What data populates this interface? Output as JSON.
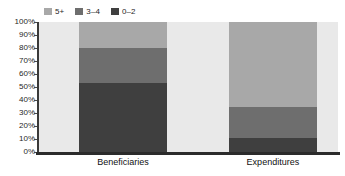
{
  "chart_data": {
    "type": "bar",
    "subtype": "stacked-percent-column",
    "title": "",
    "subtitle": "",
    "xlabel": "",
    "ylabel": "",
    "categories": [
      "Beneficiaries",
      "Expenditures"
    ],
    "series": [
      {
        "name": "0–2",
        "values": [
          53,
          11
        ],
        "color": "#3f3f3f"
      },
      {
        "name": "3–4",
        "values": [
          27,
          24
        ],
        "color": "#6e6e6e"
      },
      {
        "name": "5+",
        "values": [
          20,
          65
        ],
        "color": "#a8a8a8"
      }
    ],
    "stack_order_bottom_to_top": [
      "0–2",
      "3–4",
      "5+"
    ],
    "ylim": [
      0,
      100
    ],
    "ytick_values": [
      0,
      10,
      20,
      30,
      40,
      50,
      60,
      70,
      80,
      90,
      100
    ],
    "ytick_labels": [
      "0%",
      "10%",
      "20%",
      "30%",
      "40%",
      "50%",
      "60%",
      "70%",
      "80%",
      "90%",
      "100%"
    ],
    "grid": false,
    "legend_position": "top-left",
    "legend_order": [
      "5+",
      "3–4",
      "0–2"
    ],
    "plot_background": "#e9e9e9",
    "axis_color": "#2b2b2b"
  },
  "legend": {
    "items": [
      {
        "label": "5+",
        "color": "#a8a8a8"
      },
      {
        "label": "3–4",
        "color": "#6e6e6e"
      },
      {
        "label": "0–2",
        "color": "#3f3f3f"
      }
    ]
  },
  "yaxis": {
    "labels": [
      "100%",
      "90%",
      "80%",
      "70%",
      "60%",
      "50%",
      "40%",
      "30%",
      "20%",
      "10%",
      "0%"
    ]
  },
  "xaxis": {
    "labels": [
      "Beneficiaries",
      "Expenditures"
    ]
  }
}
